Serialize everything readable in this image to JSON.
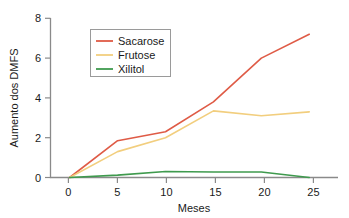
{
  "chart_data": {
    "type": "line",
    "title": "",
    "xlabel": "Meses",
    "ylabel": "Aumento dos DMFS",
    "x": [
      0,
      5,
      10,
      15,
      20,
      25
    ],
    "xlim": [
      -2,
      28
    ],
    "ylim": [
      0,
      8
    ],
    "xticks": [
      "0",
      "5",
      "10",
      "15",
      "20",
      "25"
    ],
    "yticks": [
      "0",
      "2",
      "4",
      "6",
      "8"
    ],
    "grid": false,
    "legend_position": "upper-left-inside",
    "series": [
      {
        "name": "Sacarose",
        "color": "#df5b46",
        "values": [
          0,
          1.85,
          2.3,
          3.8,
          6.0,
          7.2
        ]
      },
      {
        "name": "Frutose",
        "color": "#f2ce7e",
        "values": [
          0,
          1.3,
          2.0,
          3.35,
          3.1,
          3.3
        ]
      },
      {
        "name": "Xilitol",
        "color": "#3f9a4e",
        "values": [
          0,
          0.12,
          0.3,
          0.28,
          0.28,
          0.0
        ]
      }
    ]
  },
  "axes": {
    "x_title": "Meses",
    "y_title": "Aumento dos DMFS",
    "x_tick_labels": [
      "0",
      "5",
      "10",
      "15",
      "20",
      "25"
    ],
    "y_tick_labels": [
      "0",
      "2",
      "4",
      "6",
      "8"
    ]
  },
  "legend": {
    "entries": [
      {
        "label": "Sacarose",
        "color": "#df5b46"
      },
      {
        "label": "Frutose",
        "color": "#f2ce7e"
      },
      {
        "label": "Xilitol",
        "color": "#3f9a4e"
      }
    ]
  },
  "colors": {
    "axis": "#8a8a8a",
    "text": "#1a1a1a",
    "background": "#ffffff",
    "legend_border": "#9a9a9a"
  }
}
